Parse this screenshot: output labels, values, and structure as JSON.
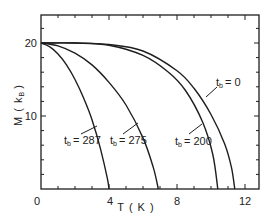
{
  "chart_data": {
    "type": "line",
    "title": "",
    "xlabel": "T ( K )",
    "ylabel": "M ( k_B )",
    "xlim": [
      0,
      13
    ],
    "ylim": [
      0,
      24
    ],
    "x_ticks": [
      0,
      4,
      8,
      12
    ],
    "x_tick_labels": [
      "0",
      "4",
      "8",
      "12"
    ],
    "y_ticks": [
      0,
      10,
      20
    ],
    "y_tick_labels": [
      "0",
      "10",
      "20"
    ],
    "grid": false,
    "legend": "none (inline curve labels)",
    "series": [
      {
        "name": "t_b = 0",
        "label_text": "t",
        "label_sub": "b",
        "label_value": "= 0",
        "x": [
          0,
          2,
          4,
          6,
          8,
          9,
          10,
          10.8,
          11.2,
          11.4
        ],
        "y": [
          20,
          20,
          19.8,
          18.9,
          16.2,
          13.8,
          10.2,
          6.2,
          3.0,
          0
        ]
      },
      {
        "name": "t_b = 200",
        "label_text": "t",
        "label_sub": "b",
        "label_value": "= 200",
        "x": [
          0,
          2,
          4,
          6,
          7.5,
          8.5,
          9.5,
          10.1,
          10.4
        ],
        "y": [
          20,
          20,
          19.7,
          18.3,
          16.0,
          13.5,
          9.2,
          4.8,
          0
        ]
      },
      {
        "name": "t_b = 275",
        "label_text": "t",
        "label_sub": "b",
        "label_value": "= 275",
        "x": [
          0,
          1,
          2,
          3,
          4,
          5,
          6,
          6.6,
          6.9
        ],
        "y": [
          20,
          19.6,
          18.6,
          17.0,
          14.6,
          11.5,
          7.0,
          3.0,
          0
        ]
      },
      {
        "name": "t_b = 287",
        "label_text": "t",
        "label_sub": "b",
        "label_value": "= 287",
        "x": [
          0,
          0.5,
          1,
          1.5,
          2,
          2.5,
          3,
          3.5,
          3.9,
          4.0
        ],
        "y": [
          20,
          19.5,
          18.5,
          17.0,
          15.0,
          12.5,
          9.5,
          5.5,
          1.5,
          0
        ]
      }
    ]
  },
  "axes": {
    "x_title": "T ( K )",
    "y_title": "M ( k",
    "y_title_sub": "B",
    "y_title_close": ")"
  },
  "labels": {
    "tb0": {
      "t": "t",
      "sub": "b",
      "val": "= 0"
    },
    "tb200": {
      "t": "t",
      "sub": "b",
      "val": "= 200"
    },
    "tb275": {
      "t": "t",
      "sub": "b",
      "val": "= 275"
    },
    "tb287": {
      "t": "t",
      "sub": "b",
      "val": "= 287"
    }
  },
  "ticks": {
    "x0": "0",
    "x4": "4",
    "x8": "8",
    "x12": "12",
    "y0": "0",
    "y10": "10",
    "y20": "20"
  },
  "colors": {
    "line": "#1e1e1e",
    "background": "#ffffff"
  }
}
